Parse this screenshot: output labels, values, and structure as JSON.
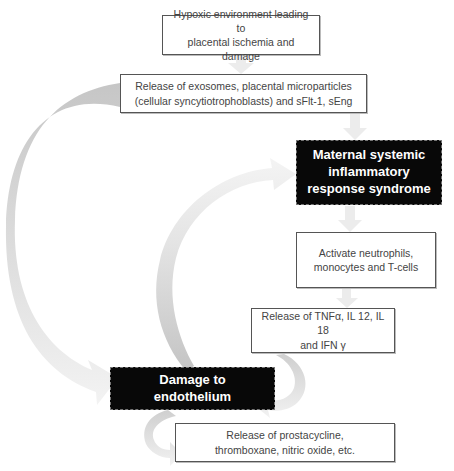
{
  "diagram": {
    "type": "flowchart",
    "nodes": [
      {
        "id": "b1",
        "label": "Hypoxic environment leading to\nplacental ischemia and damage",
        "style": "outlined"
      },
      {
        "id": "b2",
        "label": "Release of exosomes, placental microparticles\n(cellular syncytiotrophoblasts) and sFlt-1, sEng",
        "style": "outlined"
      },
      {
        "id": "b3",
        "label": "Maternal systemic\ninflammatory\nresponse syndrome",
        "style": "black-highlight"
      },
      {
        "id": "b4",
        "label": "Activate neutrophils,\nmonocytes and T-cells",
        "style": "outlined"
      },
      {
        "id": "b5",
        "label": "Release of TNFα, IL 12, IL 18\nand IFN γ",
        "style": "outlined"
      },
      {
        "id": "b6",
        "label": "Damage to\nendothelium",
        "style": "black-highlight"
      },
      {
        "id": "b7",
        "label": "Release of prostacycline,\nthromboxane, nitric oxide, etc.",
        "style": "outlined"
      }
    ],
    "edges": [
      {
        "from": "b1",
        "to": "b2",
        "kind": "straight-down"
      },
      {
        "from": "b2",
        "to": "b3",
        "kind": "straight-down"
      },
      {
        "from": "b3",
        "to": "b4",
        "kind": "straight-down"
      },
      {
        "from": "b4",
        "to": "b5",
        "kind": "straight-down"
      },
      {
        "from": "b2",
        "to": "b6",
        "kind": "curved-left"
      },
      {
        "from": "b6",
        "to": "b3",
        "kind": "curved-up"
      },
      {
        "from": "b5",
        "to": "b6",
        "kind": "curved-hook"
      },
      {
        "from": "b6",
        "to": "b7",
        "kind": "curved-hook"
      }
    ],
    "colors": {
      "arrow_dark": "#c8c8c8",
      "arrow_light": "#f0f0f0",
      "highlight_bg": "#080808",
      "highlight_text": "#ffffff",
      "box_border": "#555555",
      "text": "#444444"
    }
  }
}
